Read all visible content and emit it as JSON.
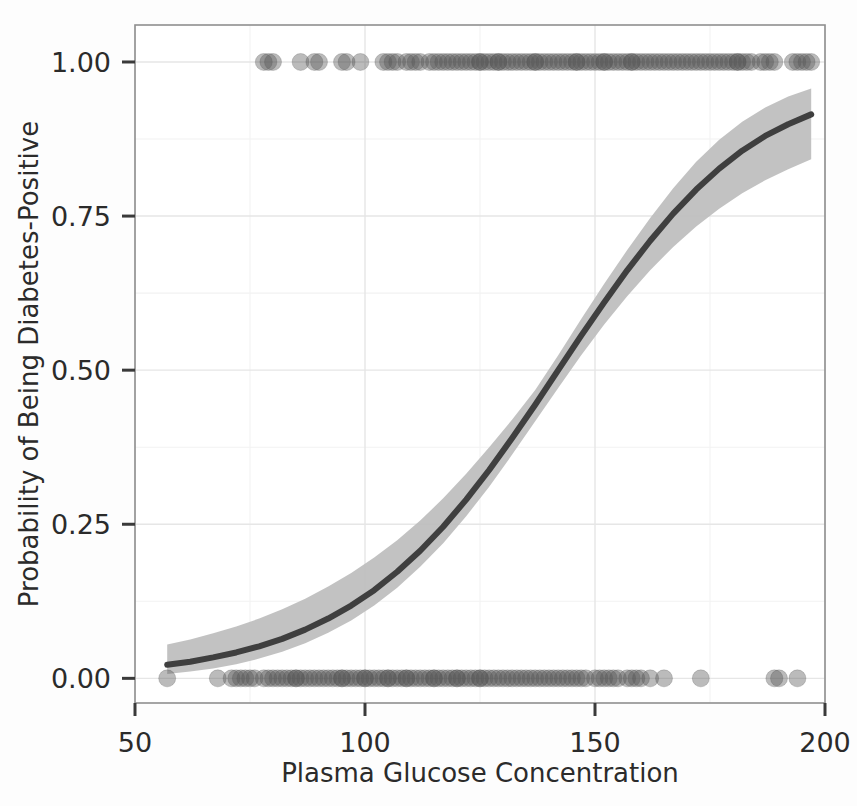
{
  "chart_data": {
    "type": "line",
    "title": "",
    "subtitle": "",
    "xlabel": "Plasma Glucose Concentration",
    "ylabel": "Probability of Being Diabetes-Positive",
    "xlim": [
      50,
      200
    ],
    "ylim": [
      -0.04,
      1.06
    ],
    "xticks": [
      50,
      100,
      150,
      200
    ],
    "xticklabels": [
      "50",
      "100",
      "150",
      "200"
    ],
    "yticks": [
      0.0,
      0.25,
      0.5,
      0.75,
      1.0
    ],
    "yticklabels": [
      "0.00",
      "0.25",
      "0.50",
      "0.75",
      "1.00"
    ],
    "grid": true,
    "grid_major_color": "#e6e6e6",
    "grid_minor_color": "#f2f2f2",
    "legend": "none",
    "panel_background": "#ffffff",
    "figure_background": "#fdfdfd",
    "series": [
      {
        "name": "Logistic fit",
        "type": "line",
        "color": "#3f3f3f",
        "x": [
          57,
          62,
          67,
          72,
          77,
          82,
          87,
          92,
          97,
          102,
          107,
          112,
          117,
          122,
          127,
          132,
          137,
          142,
          147,
          152,
          157,
          162,
          167,
          172,
          177,
          182,
          187,
          192,
          197
        ],
        "y": [
          0.022,
          0.027,
          0.034,
          0.042,
          0.052,
          0.064,
          0.079,
          0.097,
          0.118,
          0.143,
          0.173,
          0.207,
          0.246,
          0.29,
          0.338,
          0.39,
          0.444,
          0.5,
          0.556,
          0.61,
          0.662,
          0.71,
          0.754,
          0.793,
          0.827,
          0.856,
          0.88,
          0.899,
          0.915
        ]
      },
      {
        "name": "95% confidence band (lower)",
        "type": "line",
        "color": "#bdbdbd",
        "x": [
          57,
          62,
          67,
          72,
          77,
          82,
          87,
          92,
          97,
          102,
          107,
          112,
          117,
          122,
          127,
          132,
          137,
          142,
          147,
          152,
          157,
          162,
          167,
          172,
          177,
          182,
          187,
          192,
          197
        ],
        "y": [
          0.007,
          0.011,
          0.016,
          0.023,
          0.032,
          0.043,
          0.057,
          0.074,
          0.094,
          0.118,
          0.147,
          0.181,
          0.219,
          0.263,
          0.311,
          0.363,
          0.417,
          0.471,
          0.524,
          0.574,
          0.62,
          0.662,
          0.7,
          0.733,
          0.762,
          0.787,
          0.808,
          0.826,
          0.842
        ]
      },
      {
        "name": "95% confidence band (upper)",
        "type": "line",
        "color": "#bdbdbd",
        "x": [
          57,
          62,
          67,
          72,
          77,
          82,
          87,
          92,
          97,
          102,
          107,
          112,
          117,
          122,
          127,
          132,
          137,
          142,
          147,
          152,
          157,
          162,
          167,
          172,
          177,
          182,
          187,
          192,
          197
        ],
        "y": [
          0.055,
          0.063,
          0.073,
          0.084,
          0.097,
          0.112,
          0.129,
          0.149,
          0.171,
          0.196,
          0.224,
          0.256,
          0.292,
          0.332,
          0.375,
          0.42,
          0.468,
          0.524,
          0.583,
          0.64,
          0.695,
          0.747,
          0.795,
          0.838,
          0.874,
          0.903,
          0.926,
          0.944,
          0.957
        ]
      },
      {
        "name": "Observations (outcome = 1)",
        "type": "scatter",
        "color": "#555555",
        "opacity": 0.4,
        "y_value": 1.0,
        "x": [
          78,
          79,
          80,
          86,
          89,
          90,
          95,
          96,
          99,
          104,
          105,
          106,
          107,
          109,
          110,
          111,
          112,
          114,
          115,
          116,
          117,
          118,
          119,
          120,
          121,
          122,
          123,
          124,
          125,
          125,
          126,
          127,
          128,
          129,
          129,
          130,
          131,
          132,
          133,
          134,
          135,
          136,
          137,
          137,
          138,
          139,
          140,
          141,
          142,
          143,
          144,
          145,
          146,
          146,
          147,
          148,
          149,
          150,
          151,
          152,
          152,
          153,
          154,
          155,
          156,
          157,
          158,
          158,
          159,
          160,
          161,
          162,
          163,
          164,
          165,
          166,
          167,
          168,
          169,
          170,
          171,
          172,
          173,
          174,
          175,
          176,
          177,
          178,
          179,
          180,
          181,
          181,
          182,
          183,
          184,
          186,
          187,
          188,
          189,
          193,
          194,
          195,
          196,
          197
        ]
      },
      {
        "name": "Observations (outcome = 0)",
        "type": "scatter",
        "color": "#555555",
        "opacity": 0.4,
        "y_value": 0.0,
        "x": [
          57,
          68,
          71,
          72,
          73,
          74,
          75,
          76,
          78,
          79,
          80,
          81,
          82,
          83,
          84,
          85,
          85,
          86,
          87,
          88,
          89,
          90,
          91,
          92,
          93,
          94,
          95,
          95,
          96,
          97,
          98,
          99,
          100,
          100,
          101,
          102,
          103,
          104,
          105,
          105,
          106,
          107,
          108,
          109,
          109,
          110,
          111,
          112,
          113,
          114,
          115,
          115,
          116,
          117,
          118,
          119,
          120,
          120,
          121,
          122,
          123,
          124,
          125,
          125,
          126,
          127,
          128,
          129,
          130,
          131,
          132,
          133,
          134,
          135,
          136,
          137,
          138,
          139,
          140,
          141,
          142,
          143,
          144,
          145,
          146,
          147,
          148,
          150,
          151,
          152,
          153,
          154,
          155,
          157,
          158,
          159,
          160,
          162,
          165,
          173,
          189,
          190,
          194
        ]
      }
    ]
  },
  "axes": {
    "x_title": "Plasma Glucose Concentration",
    "y_title": "Probability of Being Diabetes-Positive",
    "x_tick_labels": [
      "50",
      "100",
      "150",
      "200"
    ],
    "y_tick_labels": [
      "0.00",
      "0.25",
      "0.50",
      "0.75",
      "1.00"
    ]
  },
  "colors": {
    "fit_line": "#3f3f3f",
    "confidence_band": "#bdbdbd",
    "points": "#555555",
    "grid_major": "#e6e6e6",
    "grid_minor": "#f2f2f2",
    "panel_border": "#8f8f8f",
    "text": "#2b2b2b"
  }
}
